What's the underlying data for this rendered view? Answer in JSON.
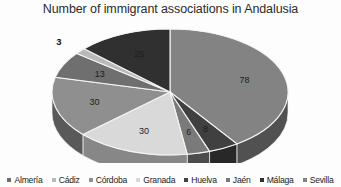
{
  "chart_data": {
    "type": "pie",
    "title": "Number of immigrant associations in Andalusia",
    "xlabel": "",
    "ylabel": "",
    "legend_position": "bottom",
    "three_d": true,
    "categories": [
      "Almería",
      "Cádiz",
      "Córdoba",
      "Granada",
      "Huelva",
      "Jaén",
      "Málaga",
      "Sevilla"
    ],
    "values": [
      13,
      3,
      30,
      30,
      8,
      6,
      25,
      78
    ],
    "labels_shown": [
      "13",
      "3",
      "30",
      "30",
      "8",
      "6",
      "25",
      "78"
    ],
    "colors": [
      "#6f6f6f",
      "#b9b9b9",
      "#8f8f8f",
      "#d9d9d9",
      "#404040",
      "#7a7a7a",
      "#303030",
      "#838383"
    ],
    "total": 193,
    "slices": [
      {
        "name": "Sevilla",
        "value": 78,
        "label": "78",
        "color": "#838383",
        "label_placement": "inside"
      },
      {
        "name": "Huelva",
        "value": 8,
        "label": "8",
        "color": "#404040",
        "label_placement": "inside"
      },
      {
        "name": "Jaén",
        "value": 6,
        "label": "6",
        "color": "#7a7a7a",
        "label_placement": "inside"
      },
      {
        "name": "Granada",
        "value": 30,
        "label": "30",
        "color": "#d9d9d9",
        "label_placement": "inside"
      },
      {
        "name": "Córdoba",
        "value": 30,
        "label": "30",
        "color": "#8f8f8f",
        "label_placement": "inside"
      },
      {
        "name": "Almería",
        "value": 13,
        "label": "13",
        "color": "#6f6f6f",
        "label_placement": "inside"
      },
      {
        "name": "Cádiz",
        "value": 3,
        "label": "3",
        "color": "#b9b9b9",
        "label_placement": "outside"
      },
      {
        "name": "Málaga",
        "value": 25,
        "label": "25",
        "color": "#303030",
        "label_placement": "inside"
      }
    ]
  },
  "legend": {
    "items": [
      {
        "label": "Almería",
        "color": "#6f6f6f"
      },
      {
        "label": "Cádiz",
        "color": "#b9b9b9"
      },
      {
        "label": "Córdoba",
        "color": "#8f8f8f"
      },
      {
        "label": "Granada",
        "color": "#d9d9d9"
      },
      {
        "label": "Huelva",
        "color": "#404040"
      },
      {
        "label": "Jaén",
        "color": "#7a7a7a"
      },
      {
        "label": "Málaga",
        "color": "#303030"
      },
      {
        "label": "Sevilla",
        "color": "#838383"
      }
    ]
  }
}
